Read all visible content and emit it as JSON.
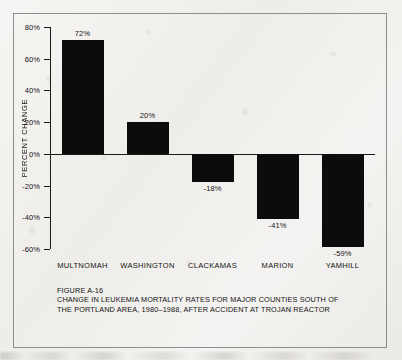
{
  "figure": {
    "number": "FIGURE A-16",
    "caption_line_1": "CHANGE IN LEUKEMIA MORTALITY RATES FOR MAJOR COUNTIES SOUTH OF",
    "caption_line_2": "THE PORTLAND AREA, 1980–1988, AFTER ACCIDENT AT TROJAN REACTOR"
  },
  "chart_data": {
    "type": "bar",
    "title": "CHANGE IN LEUKEMIA MORTALITY RATES FOR MAJOR COUNTIES SOUTH OF THE PORTLAND AREA, 1980–1988, AFTER ACCIDENT AT TROJAN REACTOR",
    "xlabel": "",
    "ylabel": "PERCENT CHANGE",
    "categories": [
      "MULTNOMAH",
      "WASHINGTON",
      "CLACKAMAS",
      "MARION",
      "YAMHILL"
    ],
    "values": [
      72,
      20,
      -18,
      -41,
      -59
    ],
    "value_labels": [
      "72%",
      "20%",
      "-18%",
      "-41%",
      "-59%"
    ],
    "ylim": [
      -60,
      80
    ],
    "yticks": [
      80,
      60,
      40,
      20,
      0,
      -20,
      -40,
      -60
    ],
    "ytick_labels": [
      "80%",
      "60%",
      "40%",
      "20%",
      "0%",
      "-20%",
      "-40%",
      "-60%"
    ],
    "grid": false,
    "legend": false,
    "bar_color": "#0c0c0c",
    "axis_color": "#1a1a1a",
    "background_color": "#f2f1ef"
  }
}
